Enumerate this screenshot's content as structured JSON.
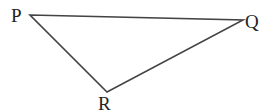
{
  "diagram": {
    "type": "triangle",
    "vertices": [
      {
        "id": "P",
        "label": "P",
        "x": 30,
        "y": 15
      },
      {
        "id": "Q",
        "label": "Q",
        "x": 243,
        "y": 20
      },
      {
        "id": "R",
        "label": "R",
        "x": 107,
        "y": 92
      }
    ],
    "edges": [
      {
        "from": "P",
        "to": "Q"
      },
      {
        "from": "Q",
        "to": "R"
      },
      {
        "from": "R",
        "to": "P"
      }
    ],
    "line_color": "#444444",
    "label_color": "#222222"
  }
}
